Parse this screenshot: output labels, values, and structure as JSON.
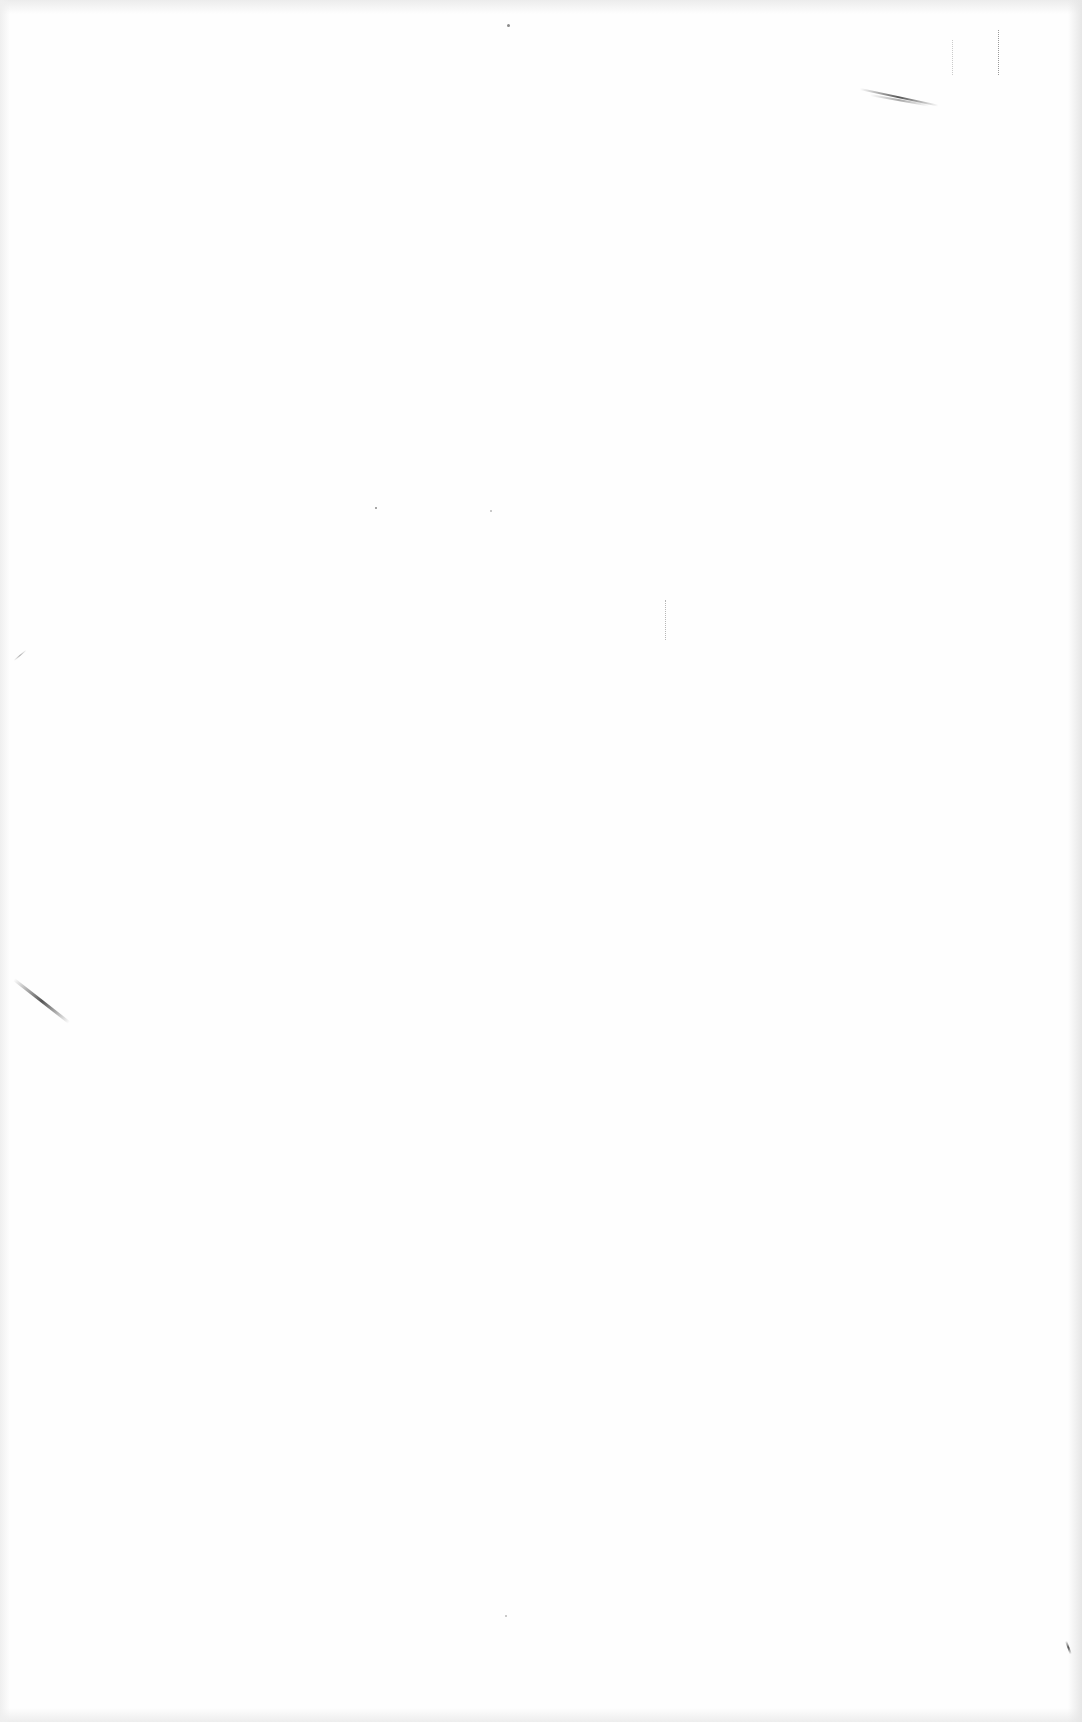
{
  "page": {
    "type": "blank-scanned-page",
    "background_color": "#fefefe",
    "text_content": []
  }
}
